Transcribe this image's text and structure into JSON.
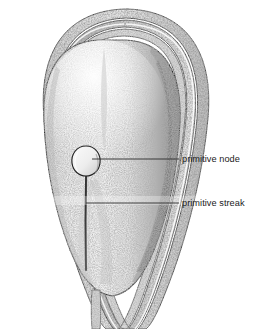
{
  "figure": {
    "background_color": "#ffffff",
    "ink_color": "#1b1b1b",
    "width": 253,
    "height": 329,
    "style": "stippled pen-and-ink anatomical illustration"
  },
  "labels": [
    {
      "id": "primitive-node",
      "text": "primitive node",
      "text_x": 182,
      "text_y": 162,
      "leader_from_x": 92,
      "leader_from_y": 159,
      "leader_to_x": 179,
      "leader_to_y": 159
    },
    {
      "id": "primitive-streak",
      "text": "primitive streak",
      "text_x": 182,
      "text_y": 206,
      "leader_from_x": 86,
      "leader_from_y": 203,
      "leader_to_x": 179,
      "leader_to_y": 203
    }
  ],
  "structures": [
    {
      "id": "amnion-outer-fold",
      "name": "outer membrane fold"
    },
    {
      "id": "amnion-middle-fold",
      "name": "middle membrane fold"
    },
    {
      "id": "amnion-inner-fold",
      "name": "inner membrane fold"
    },
    {
      "id": "embryonic-disc",
      "name": "embryonic disc"
    },
    {
      "id": "primitive-node-body",
      "name": "primitive node"
    },
    {
      "id": "primitive-streak-groove",
      "name": "primitive streak groove"
    },
    {
      "id": "tail-stalk",
      "name": "caudal stalk"
    }
  ],
  "colors": {
    "ink": "#1b1b1b",
    "outline": "#2a2a2a",
    "disc_light": "#efefef",
    "disc_mid": "#d2d2d2",
    "disc_shadow": "#8f8f8f",
    "fold_shade": "#b8b8b8",
    "band_artifact": "#f4f4f4"
  }
}
